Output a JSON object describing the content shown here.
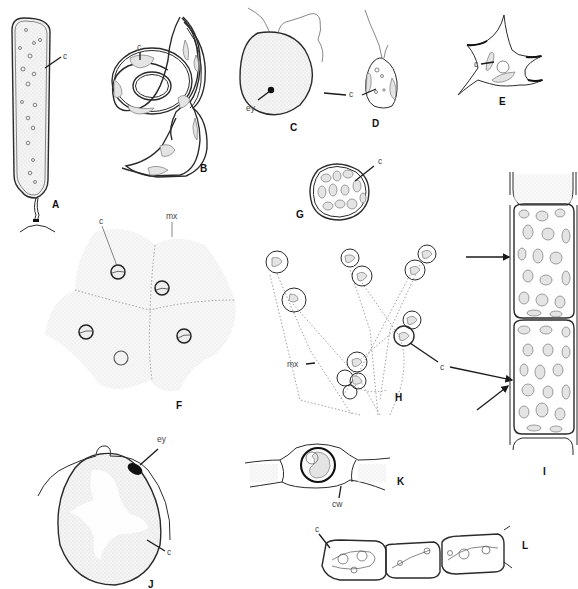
{
  "figure": {
    "panels": [
      {
        "id": "A",
        "label": "A",
        "annotations": [
          "c"
        ]
      },
      {
        "id": "B",
        "label": "B",
        "annotations": [
          "c"
        ]
      },
      {
        "id": "C",
        "label": "C",
        "annotations": [
          "ey",
          "c"
        ]
      },
      {
        "id": "D",
        "label": "D",
        "annotations": [
          "c"
        ]
      },
      {
        "id": "E",
        "label": "E",
        "annotations": [
          "c"
        ]
      },
      {
        "id": "F",
        "label": "F",
        "annotations": [
          "c",
          "mx"
        ]
      },
      {
        "id": "G",
        "label": "G",
        "annotations": [
          "c"
        ]
      },
      {
        "id": "H",
        "label": "H",
        "annotations": [
          "mx",
          "c"
        ]
      },
      {
        "id": "I",
        "label": "I",
        "annotations": []
      },
      {
        "id": "J",
        "label": "J",
        "annotations": [
          "ey",
          "c"
        ]
      },
      {
        "id": "K",
        "label": "K",
        "annotations": [
          "cw"
        ]
      },
      {
        "id": "L",
        "label": "L",
        "annotations": [
          "c"
        ]
      }
    ],
    "terms": {
      "c": "c",
      "ey": "ey",
      "mx": "mx",
      "cw": "cw"
    }
  }
}
